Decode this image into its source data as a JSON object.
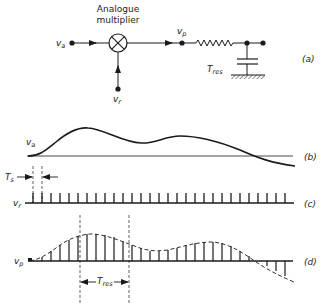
{
  "figure": {
    "panel_a": {
      "multiplier_label_line1": "Analogue",
      "multiplier_label_line2": "multiplier",
      "input_signal": {
        "symbol": "v",
        "subscript": "a"
      },
      "reference_signal": {
        "symbol": "v",
        "subscript": "r"
      },
      "product_signal": {
        "symbol": "v",
        "subscript": "p"
      },
      "filter_time_constant": {
        "symbol": "T",
        "subscript": "res"
      },
      "panel_tag": "(a)"
    },
    "panel_b": {
      "signal": {
        "symbol": "v",
        "subscript": "a"
      },
      "panel_tag": "(b)"
    },
    "panel_c": {
      "signal": {
        "symbol": "v",
        "subscript": "r"
      },
      "sampling_period": {
        "symbol": "T",
        "subscript": "s"
      },
      "pulse_count": 29,
      "panel_tag": "(c)"
    },
    "panel_d": {
      "signal": {
        "symbol": "v",
        "subscript": "p"
      },
      "window": {
        "symbol": "T",
        "subscript": "res"
      },
      "panel_tag": "(d)"
    },
    "colors": {
      "ink": "#1a1a1a",
      "background": "#ffffff"
    }
  }
}
